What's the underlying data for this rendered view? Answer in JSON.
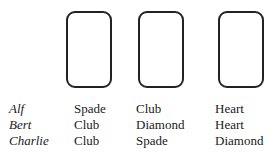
{
  "cards": [
    {
      "position": 1
    },
    {
      "position": 2
    },
    {
      "position": 3
    }
  ],
  "players": [
    {
      "name": "Alf",
      "guesses": [
        "Spade",
        "Club",
        "Heart"
      ]
    },
    {
      "name": "Bert",
      "guesses": [
        "Club",
        "Diamond",
        "Heart"
      ]
    },
    {
      "name": "Charlie",
      "guesses": [
        "Club",
        "Spade",
        "Diamond"
      ]
    }
  ]
}
